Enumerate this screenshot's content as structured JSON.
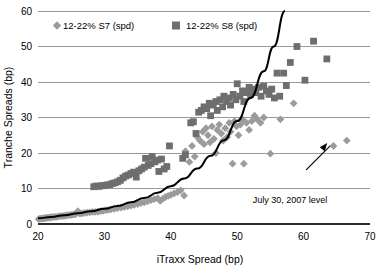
{
  "chart_data": {
    "type": "scatter",
    "title": "",
    "xlabel": "iTraxx Spread (bp)",
    "ylabel": "Tranche Spreads (bp)",
    "xlim": [
      20,
      70
    ],
    "ylim": [
      0,
      60
    ],
    "xticks": [
      20,
      30,
      40,
      50,
      60,
      70
    ],
    "yticks": [
      0,
      10,
      20,
      30,
      40,
      50,
      60
    ],
    "grid": true,
    "legend_position": "top-left-inside",
    "annotations": [
      {
        "text": "July 30, 2007 level",
        "x": 64,
        "y": 22,
        "arrow": true
      }
    ],
    "series": [
      {
        "name": "12-22% S7 (spd)",
        "marker": "diamond",
        "color": "#9b9b9b",
        "points": [
          [
            20.1,
            1.4
          ],
          [
            20.3,
            1.5
          ],
          [
            20.5,
            1.5
          ],
          [
            20.7,
            1.6
          ],
          [
            20.9,
            1.6
          ],
          [
            21.1,
            1.7
          ],
          [
            21.3,
            1.7
          ],
          [
            21.5,
            1.8
          ],
          [
            21.7,
            1.8
          ],
          [
            21.9,
            1.9
          ],
          [
            22.1,
            1.9
          ],
          [
            22.4,
            2.0
          ],
          [
            22.7,
            2.0
          ],
          [
            23.0,
            2.1
          ],
          [
            23.3,
            2.2
          ],
          [
            23.6,
            2.2
          ],
          [
            23.9,
            2.3
          ],
          [
            24.2,
            2.4
          ],
          [
            24.5,
            2.5
          ],
          [
            24.8,
            2.5
          ],
          [
            25.1,
            2.6
          ],
          [
            25.4,
            2.7
          ],
          [
            25.7,
            2.8
          ],
          [
            26.0,
            3.6
          ],
          [
            26.3,
            2.9
          ],
          [
            26.6,
            3.0
          ],
          [
            27.0,
            3.1
          ],
          [
            27.4,
            3.2
          ],
          [
            27.8,
            3.3
          ],
          [
            28.2,
            3.4
          ],
          [
            28.6,
            3.4
          ],
          [
            29.0,
            3.5
          ],
          [
            29.4,
            3.6
          ],
          [
            29.8,
            3.7
          ],
          [
            30.2,
            3.9
          ],
          [
            30.6,
            4.0
          ],
          [
            31.0,
            4.1
          ],
          [
            31.5,
            4.3
          ],
          [
            32.0,
            4.5
          ],
          [
            32.5,
            4.6
          ],
          [
            33.0,
            4.8
          ],
          [
            33.5,
            5.0
          ],
          [
            34.0,
            5.2
          ],
          [
            34.5,
            5.4
          ],
          [
            35.0,
            5.6
          ],
          [
            35.5,
            5.9
          ],
          [
            36.0,
            6.1
          ],
          [
            36.5,
            6.4
          ],
          [
            37.0,
            6.7
          ],
          [
            37.5,
            7.0
          ],
          [
            38.0,
            7.3
          ],
          [
            38.4,
            6.5
          ],
          [
            38.8,
            7.1
          ],
          [
            39.2,
            7.6
          ],
          [
            39.6,
            7.9
          ],
          [
            40.0,
            8.2
          ],
          [
            40.5,
            8.6
          ],
          [
            41.0,
            9.0
          ],
          [
            41.5,
            9.5
          ],
          [
            42.0,
            8.0
          ],
          [
            42.2,
            20.5
          ],
          [
            42.8,
            17.5
          ],
          [
            43.2,
            22.0
          ],
          [
            43.6,
            19.0
          ],
          [
            44.0,
            24.5
          ],
          [
            44.4,
            23.5
          ],
          [
            44.8,
            26.0
          ],
          [
            45.0,
            22.5
          ],
          [
            45.3,
            27.0
          ],
          [
            45.6,
            25.0
          ],
          [
            45.9,
            23.0
          ],
          [
            46.2,
            27.5
          ],
          [
            46.5,
            24.0
          ],
          [
            46.8,
            20.0
          ],
          [
            47.0,
            26.5
          ],
          [
            47.3,
            28.0
          ],
          [
            47.6,
            25.5
          ],
          [
            47.9,
            23.5
          ],
          [
            48.2,
            27.0
          ],
          [
            48.5,
            24.5
          ],
          [
            48.8,
            28.5
          ],
          [
            49.0,
            26.0
          ],
          [
            49.3,
            17.0
          ],
          [
            49.6,
            29.0
          ],
          [
            49.9,
            27.5
          ],
          [
            50.2,
            25.0
          ],
          [
            50.5,
            28.0
          ],
          [
            50.8,
            29.5
          ],
          [
            51.0,
            17.0
          ],
          [
            51.4,
            28.5
          ],
          [
            51.8,
            26.5
          ],
          [
            52.2,
            29.0
          ],
          [
            52.6,
            30.5
          ],
          [
            53.0,
            29.5
          ],
          [
            53.5,
            28.5
          ],
          [
            54.0,
            30.0
          ],
          [
            55.0,
            19.8
          ],
          [
            56.5,
            29.5
          ],
          [
            58.5,
            34.0
          ],
          [
            64.5,
            22.0
          ],
          [
            66.5,
            23.5
          ]
        ]
      },
      {
        "name": "12-22% S8 (spd)",
        "marker": "square",
        "color": "#6e6e6e",
        "points": [
          [
            28.4,
            10.5
          ],
          [
            28.8,
            10.7
          ],
          [
            29.2,
            10.6
          ],
          [
            29.6,
            10.8
          ],
          [
            30.0,
            10.8
          ],
          [
            30.4,
            11.0
          ],
          [
            30.8,
            11.1
          ],
          [
            31.2,
            11.4
          ],
          [
            31.6,
            11.6
          ],
          [
            32.0,
            11.9
          ],
          [
            32.4,
            12.3
          ],
          [
            32.8,
            13.0
          ],
          [
            33.2,
            13.5
          ],
          [
            33.6,
            13.8
          ],
          [
            34.0,
            14.2
          ],
          [
            34.4,
            14.6
          ],
          [
            34.8,
            13.2
          ],
          [
            35.2,
            15.0
          ],
          [
            35.6,
            15.5
          ],
          [
            36.0,
            16.0
          ],
          [
            36.2,
            18.5
          ],
          [
            36.6,
            16.5
          ],
          [
            37.0,
            17.0
          ],
          [
            37.2,
            19.0
          ],
          [
            37.6,
            17.5
          ],
          [
            38.0,
            18.0
          ],
          [
            38.2,
            14.8
          ],
          [
            38.6,
            18.3
          ],
          [
            39.0,
            15.5
          ],
          [
            39.4,
            16.2
          ],
          [
            39.8,
            22.0
          ],
          [
            41.8,
            18.5
          ],
          [
            42.2,
            19.5
          ],
          [
            43.0,
            28.5
          ],
          [
            43.4,
            28.8
          ],
          [
            43.8,
            25.5
          ],
          [
            44.2,
            31.5
          ],
          [
            44.6,
            32.0
          ],
          [
            45.0,
            33.0
          ],
          [
            45.4,
            32.5
          ],
          [
            45.8,
            34.0
          ],
          [
            46.0,
            30.5
          ],
          [
            46.4,
            33.5
          ],
          [
            46.8,
            34.5
          ],
          [
            47.0,
            32.0
          ],
          [
            47.4,
            35.0
          ],
          [
            47.8,
            33.0
          ],
          [
            48.0,
            36.0
          ],
          [
            48.4,
            34.5
          ],
          [
            48.8,
            35.5
          ],
          [
            49.0,
            33.5
          ],
          [
            49.4,
            36.5
          ],
          [
            49.8,
            35.0
          ],
          [
            50.0,
            39.5
          ],
          [
            50.4,
            36.0
          ],
          [
            50.8,
            37.5
          ],
          [
            51.0,
            34.5
          ],
          [
            51.4,
            37.0
          ],
          [
            51.8,
            38.5
          ],
          [
            52.0,
            36.5
          ],
          [
            52.4,
            38.0
          ],
          [
            52.8,
            37.0
          ],
          [
            53.2,
            38.5
          ],
          [
            53.6,
            36.0
          ],
          [
            54.0,
            38.8
          ],
          [
            54.4,
            37.5
          ],
          [
            54.8,
            36.5
          ],
          [
            55.2,
            38.0
          ],
          [
            55.6,
            35.5
          ],
          [
            56.0,
            42.5
          ],
          [
            56.4,
            36.0
          ],
          [
            57.0,
            42.5
          ],
          [
            57.4,
            39.0
          ],
          [
            58.0,
            45.5
          ],
          [
            59.0,
            50.0
          ],
          [
            60.2,
            40.5
          ],
          [
            61.5,
            51.5
          ],
          [
            63.5,
            46.5
          ]
        ]
      }
    ],
    "trend_curve": {
      "label": "fitted-exponential",
      "color": "#000000",
      "points": [
        [
          20,
          1.6
        ],
        [
          22,
          2.0
        ],
        [
          24,
          2.5
        ],
        [
          26,
          3.0
        ],
        [
          28,
          3.6
        ],
        [
          30,
          4.3
        ],
        [
          32,
          5.1
        ],
        [
          34,
          6.1
        ],
        [
          36,
          7.3
        ],
        [
          38,
          8.8
        ],
        [
          40,
          10.6
        ],
        [
          42,
          12.8
        ],
        [
          44,
          15.6
        ],
        [
          46,
          19.2
        ],
        [
          48,
          23.6
        ],
        [
          50,
          29.0
        ],
        [
          52,
          35.5
        ],
        [
          54,
          43.0
        ],
        [
          55.5,
          50.0
        ],
        [
          57.2,
          60.0
        ]
      ]
    }
  }
}
